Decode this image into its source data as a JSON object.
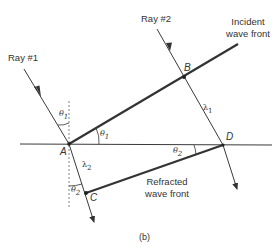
{
  "figure": {
    "caption": "(b)",
    "colors": {
      "line": "#3a3a3a",
      "thick_line": "#333333",
      "dashed": "#777777",
      "text": "#333333"
    }
  },
  "labels": {
    "ray1": "Ray #1",
    "ray2": "Ray #2",
    "incident_line1": "Incident",
    "incident_line2": "wave front",
    "refracted_line1": "Refracted",
    "refracted_line2": "wave front",
    "point_a": "A",
    "point_b": "B",
    "point_c": "C",
    "point_d": "D",
    "theta1": "θ",
    "theta1_sub": "1",
    "theta1_b": "θ",
    "theta1_b_sub": "1",
    "theta2": "θ",
    "theta2_sub": "2",
    "theta2_b": "θ",
    "theta2_b_sub": "2",
    "lambda1": "λ",
    "lambda1_sub": "1",
    "lambda2": "λ",
    "lambda2_sub": "2"
  }
}
